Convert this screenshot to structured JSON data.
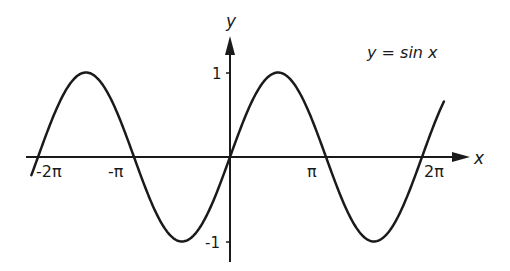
{
  "chart_data": {
    "type": "line",
    "title": "y = sin x",
    "annotation": "y = sin x",
    "xlabel": "x",
    "ylabel": "y",
    "x_ticks": [
      "-2π",
      "-π",
      "π",
      "2π"
    ],
    "y_ticks": [
      "1",
      "-1"
    ],
    "xlim": [
      -6.6,
      7.2
    ],
    "ylim": [
      -1,
      1
    ],
    "grid": false,
    "legend": "none",
    "series": [
      {
        "name": "sin x",
        "function": "sin(x)",
        "x_range": [
          -6.5,
          7.0
        ],
        "points": [
          {
            "x": -6.283,
            "y": 0
          },
          {
            "x": -4.712,
            "y": 1
          },
          {
            "x": -3.142,
            "y": 0
          },
          {
            "x": -1.571,
            "y": -1
          },
          {
            "x": 0,
            "y": 0
          },
          {
            "x": 1.571,
            "y": 1
          },
          {
            "x": 3.142,
            "y": 0
          },
          {
            "x": 4.712,
            "y": -1
          },
          {
            "x": 6.283,
            "y": 0
          }
        ]
      }
    ]
  },
  "labels": {
    "x_axis": "x",
    "y_axis": "y",
    "equation": "y = sin x",
    "tick_neg2pi": "-2π",
    "tick_negpi": "-π",
    "tick_pi": "π",
    "tick_2pi": "2π",
    "tick_y1": "1",
    "tick_yneg1": "-1"
  },
  "colors": {
    "ink": "#1a1a1a",
    "background": "#ffffff"
  }
}
